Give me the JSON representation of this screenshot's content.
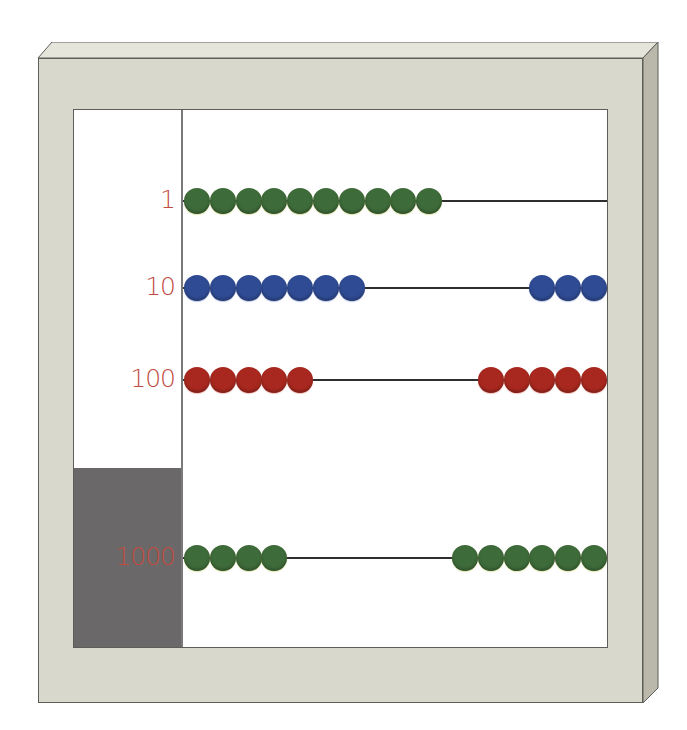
{
  "colors": {
    "frame": "#d9d8cc",
    "frame_top": "#e6e5dc",
    "frame_side": "#b9b8aa",
    "outline": "#5e5e58",
    "panel": "#ffffff",
    "gray_box": "#6a6869",
    "label": "#c24b3f",
    "rod": "#2e2e2e"
  },
  "rows": [
    {
      "label": "1",
      "rod_y": 201,
      "bead_color": "green",
      "left_count": 10,
      "right_count": 0
    },
    {
      "label": "10",
      "rod_y": 288,
      "bead_color": "blue",
      "left_count": 7,
      "right_count": 3
    },
    {
      "label": "100",
      "rod_y": 380,
      "bead_color": "red",
      "left_count": 5,
      "right_count": 5
    },
    {
      "label": "1000",
      "rod_y": 558,
      "bead_color": "green",
      "left_count": 4,
      "right_count": 6
    }
  ]
}
